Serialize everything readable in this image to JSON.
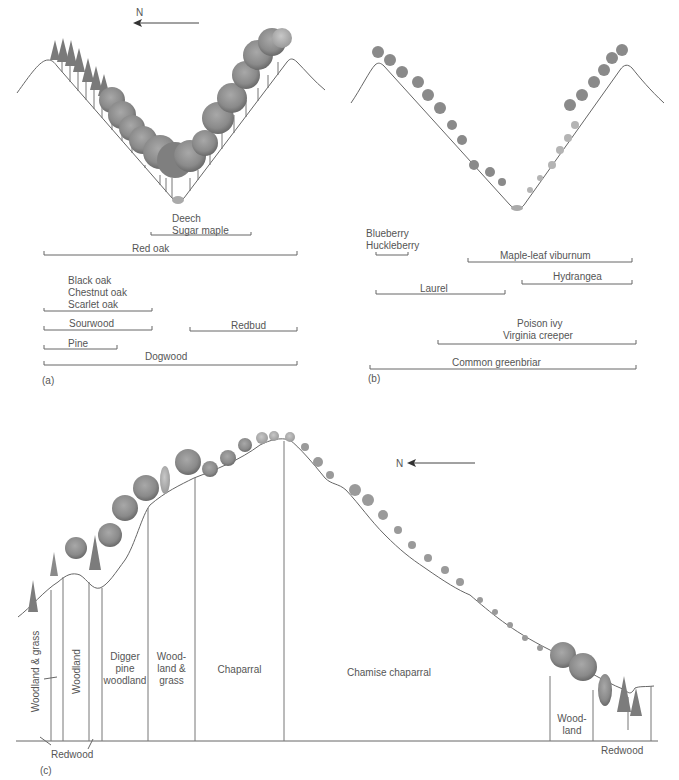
{
  "figure": {
    "panel_a": {
      "tag": "(a)",
      "compass": "N",
      "ranges": [
        {
          "label": "Deech",
          "label2": "Sugar maple"
        },
        {
          "label": "Red oak"
        },
        {
          "label": "Black oak",
          "label2": "Chestnut oak",
          "label3": "Scarlet oak"
        },
        {
          "label": "Sourwood"
        },
        {
          "label": "Redbud"
        },
        {
          "label": "Pine"
        },
        {
          "label": "Dogwood"
        }
      ]
    },
    "panel_b": {
      "tag": "(b)",
      "ranges": [
        {
          "label": "Blueberry",
          "label2": "Huckleberry"
        },
        {
          "label": "Maple-leaf viburnum"
        },
        {
          "label": "Hydrangea"
        },
        {
          "label": "Laurel"
        },
        {
          "label": "Poison ivy",
          "label2": "Virginia creeper"
        },
        {
          "label": "Common greenbriar"
        }
      ]
    },
    "panel_c": {
      "tag": "(c)",
      "compass": "N",
      "zones": [
        {
          "label": "Woodland & grass"
        },
        {
          "label": "Woodland"
        },
        {
          "label": "Digger",
          "label2": "pine",
          "label3": "woodland"
        },
        {
          "label": "Wood-",
          "label2": "land &",
          "label3": "grass"
        },
        {
          "label": "Chaparral"
        },
        {
          "label": "Chamise chaparral"
        },
        {
          "label": "Wood-",
          "label2": "land"
        }
      ],
      "redwood_left": "Redwood",
      "redwood_right": "Redwood"
    },
    "colors": {
      "line": "#666666",
      "text": "#555555",
      "foliage_dark": "#6e6e6e",
      "foliage_mid": "#8c8c8c",
      "foliage_light": "#b0b0b0"
    }
  }
}
